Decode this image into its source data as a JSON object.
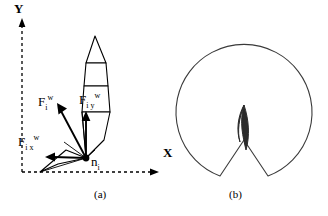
{
  "figure": {
    "panel_a": {
      "caption": "(a)",
      "axes": {
        "y_label": "Y",
        "x_label": "X",
        "style": "dashed"
      },
      "vectors": [
        {
          "name": "resultant-force",
          "base": "F",
          "sub": "i",
          "sup": "w",
          "direction": "up-left"
        },
        {
          "name": "force-y-component",
          "base": "F",
          "sub": "i y",
          "sup": "w",
          "direction": "up"
        },
        {
          "name": "force-x-component",
          "base": "F",
          "sub": "i x",
          "sup": "w",
          "direction": "left"
        }
      ],
      "origin_point": {
        "base": "n",
        "sub": "i"
      },
      "colors": {
        "stroke": "#000000",
        "fill": "#ffffff",
        "background": "#ffffff"
      }
    },
    "panel_b": {
      "caption": "(b)",
      "sensor_label": "The view sensor",
      "colors": {
        "stroke": "#3a3a3a",
        "robot_fill": "#2b2b2b",
        "background": "#ffffff"
      }
    }
  }
}
